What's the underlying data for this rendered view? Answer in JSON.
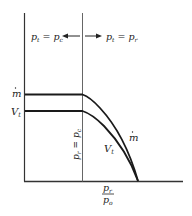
{
  "diagram": {
    "top_left_label": {
      "base": "p",
      "sub": "t",
      "eq": " = ",
      "base2": "p",
      "sub2": "c"
    },
    "top_right_label": {
      "base": "p",
      "sub": "t",
      "eq": " = ",
      "base2": "p",
      "sub2": "r"
    },
    "vertical_label": {
      "base": "p",
      "sub": "r",
      "eq": " = ",
      "base2": "p",
      "sub2": "c"
    },
    "y_labels": {
      "mdot": "m",
      "vt": "V",
      "vt_sub": "t"
    },
    "curve_labels": {
      "mdot": "m",
      "vt": "V",
      "vt_sub": "t"
    },
    "x_axis_label": {
      "num": "p",
      "num_sub": "r",
      "den": "p",
      "den_sub": "o"
    },
    "colors": {
      "line": "#1a1a1a",
      "axis": "#333333",
      "divider": "#666666"
    }
  }
}
